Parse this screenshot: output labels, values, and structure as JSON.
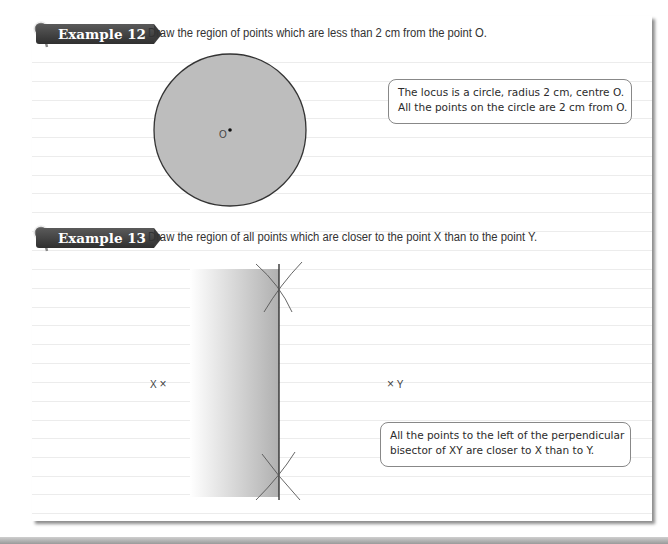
{
  "examples": [
    {
      "badge_label": "Example 12",
      "task": "Draw the region of points which are less than 2 cm from the point O.",
      "point_label": "O",
      "figure": {
        "type": "circle",
        "center": [
          230,
          130
        ],
        "radius": 76,
        "fill": "#bdbdbd",
        "stroke": "#333333"
      },
      "callout": [
        "The locus is a circle, radius 2 cm, centre O.",
        "All the points on the circle are 2 cm from O."
      ]
    },
    {
      "badge_label": "Example 13",
      "task": "Draw the region of all points which are closer to the point X than to the point Y.",
      "point_x_label": "X",
      "point_y_label": "Y",
      "cross_glyph": "×",
      "figure": {
        "type": "half-plane",
        "region_left": 190,
        "bisector_x": 279,
        "top": 269,
        "bottom": 497,
        "gradient_from": "#ffffff",
        "gradient_to": "#b0b0b0"
      },
      "callout": [
        "All the points to the left of the perpendicular",
        "bisector of XY are closer to X than to Y."
      ]
    }
  ],
  "colors": {
    "badge": "#3a3a3a",
    "rule": "#ececec",
    "text": "#333333"
  }
}
